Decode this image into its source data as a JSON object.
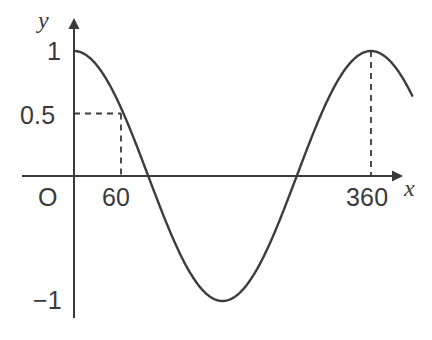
{
  "chart_data": {
    "type": "line",
    "title": "",
    "xlabel": "x",
    "ylabel": "y",
    "xlim": [
      -18,
      434
    ],
    "ylim": [
      -1.0,
      1.0
    ],
    "grid": false,
    "legend": null,
    "function": "y = cos(x)",
    "x_unit": "degrees",
    "series": [
      {
        "name": "cosine curve",
        "x": [
          0,
          15,
          30,
          45,
          60,
          75,
          90,
          105,
          120,
          135,
          150,
          165,
          180,
          195,
          210,
          225,
          240,
          255,
          270,
          285,
          300,
          315,
          330,
          345,
          360,
          375,
          390,
          405,
          410
        ],
        "values": [
          1,
          0.966,
          0.866,
          0.707,
          0.5,
          0.259,
          0,
          -0.259,
          -0.5,
          -0.707,
          -0.866,
          -0.966,
          -1,
          -0.966,
          -0.866,
          -0.707,
          -0.5,
          -0.259,
          0,
          0.259,
          0.5,
          0.707,
          0.866,
          0.966,
          1,
          0.966,
          0.866,
          0.707,
          0.643
        ]
      }
    ],
    "y_ticks": [
      {
        "value": 1,
        "label": "1"
      },
      {
        "value": 0.5,
        "label": "0.5"
      },
      {
        "value": -1,
        "label": "−1"
      }
    ],
    "x_ticks": [
      {
        "value": 60,
        "label": "60"
      },
      {
        "value": 360,
        "label": "360"
      }
    ],
    "origin_label": "O",
    "annotations": [
      {
        "name": "point-60-half",
        "x": 60,
        "y": 0.5,
        "style": "dashed-guide-lines",
        "horizontal_from_axis": true,
        "vertical_to_axis": true
      },
      {
        "name": "point-360-one",
        "x": 360,
        "y": 1,
        "style": "dashed-guide-lines",
        "horizontal_from_axis": false,
        "vertical_to_axis": true
      }
    ],
    "colors": {
      "curve": "#3c3c3c",
      "axis": "#3a3a3a",
      "dashed_guide": "#3a3a3a",
      "text": "#3a3a3a",
      "background": "#ffffff"
    }
  },
  "labels": {
    "y_axis_name": "y",
    "x_axis_name": "x",
    "y_one": "1",
    "y_half": "0.5",
    "y_neg_one": "−1",
    "origin": "O",
    "x_sixty": "60",
    "x_threesixty": "360"
  }
}
